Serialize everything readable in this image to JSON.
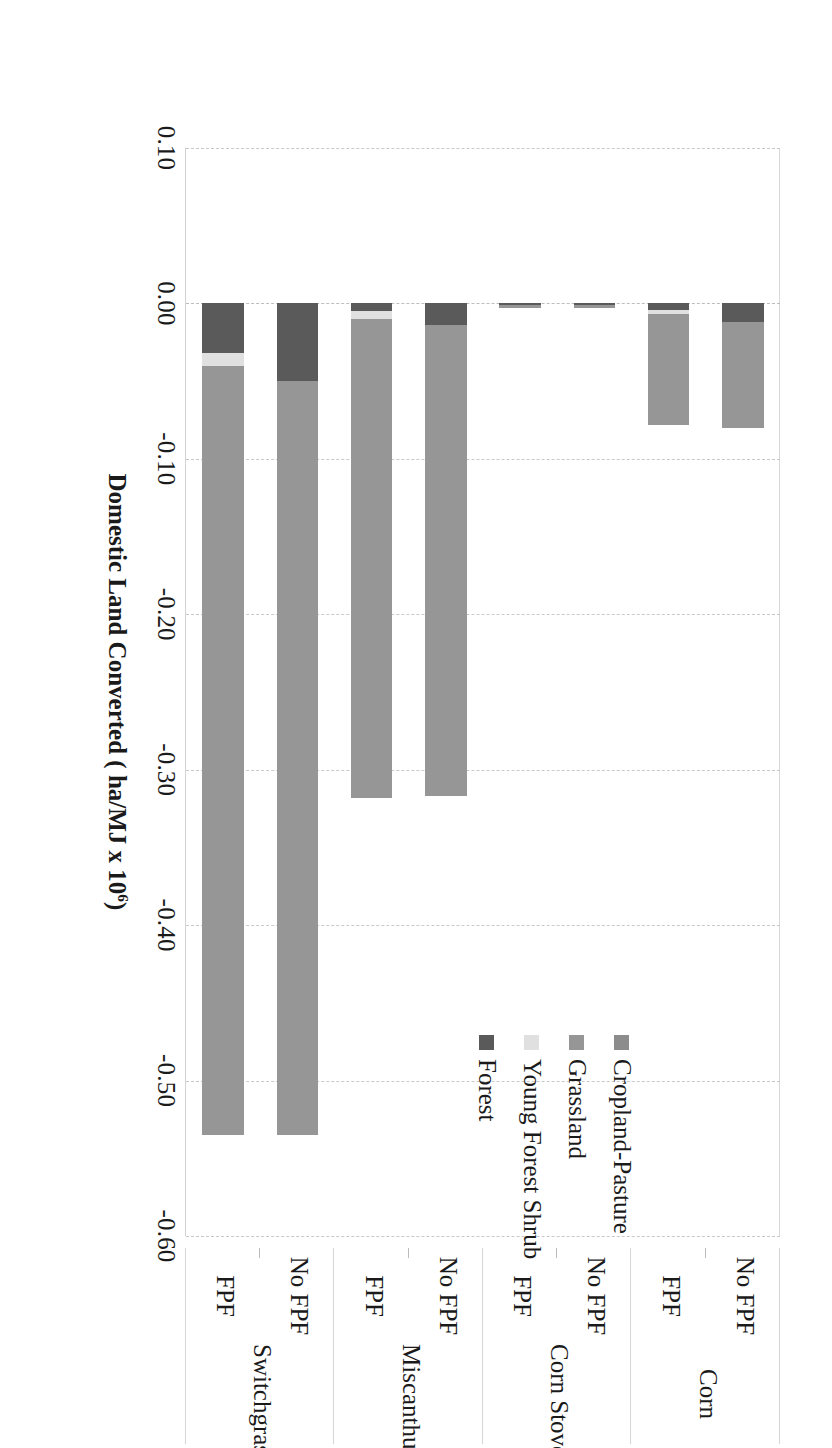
{
  "figure": {
    "orientation_note": "landscape-chart-rotated-90deg-in-portrait-page"
  },
  "chart_data": {
    "type": "bar",
    "orientation": "horizontal-stacked",
    "title": "",
    "xlabel": "Domestic Land Converted ( ha/MJ x 10⁶)",
    "ylabel": "",
    "xlim": [
      0.1,
      -0.6
    ],
    "grid": true,
    "legend_position": "inside-upper-right",
    "tick_labels": [
      "0.10",
      "0.00",
      "-0.10",
      "-0.20",
      "-0.30",
      "-0.40",
      "-0.50",
      "-0.60"
    ],
    "tick_values": [
      0.1,
      0.0,
      -0.1,
      -0.2,
      -0.3,
      -0.4,
      -0.5,
      -0.6
    ],
    "group_labels": [
      "Corn",
      "Corn Stover",
      "Miscanthus",
      "Switchgrass"
    ],
    "categories": [
      {
        "group": "Corn",
        "sub": "No FPF"
      },
      {
        "group": "Corn",
        "sub": "FPF"
      },
      {
        "group": "Corn Stover",
        "sub": "No FPF"
      },
      {
        "group": "Corn Stover",
        "sub": "FPF"
      },
      {
        "group": "Miscanthus",
        "sub": "No FPF"
      },
      {
        "group": "Miscanthus",
        "sub": "FPF"
      },
      {
        "group": "Switchgrass",
        "sub": "No FPF"
      },
      {
        "group": "Switchgrass",
        "sub": "FPF"
      }
    ],
    "series": [
      {
        "name": "Cropland-Pasture",
        "color": "#8c8c8c",
        "values": [
          0.0,
          0.0,
          0.0,
          0.0,
          0.0,
          0.0,
          0.0,
          0.0
        ]
      },
      {
        "name": "Grassland",
        "color": "#969696",
        "values": [
          -0.068,
          -0.071,
          -0.002,
          -0.002,
          -0.303,
          -0.308,
          -0.485,
          -0.495
        ]
      },
      {
        "name": "Young Forest Shrub",
        "color": "#e0e0e0",
        "values": [
          0.0,
          -0.003,
          0.0,
          0.0,
          0.0,
          -0.005,
          0.0,
          -0.008
        ]
      },
      {
        "name": "Forest",
        "color": "#5a5a5a",
        "values": [
          -0.012,
          -0.004,
          -0.001,
          -0.001,
          -0.014,
          -0.005,
          -0.05,
          -0.032
        ]
      }
    ],
    "stack_order": [
      "Forest",
      "Young Forest Shrub",
      "Grassland",
      "Cropland-Pasture"
    ],
    "bar_totals": [
      -0.08,
      -0.078,
      -0.003,
      -0.003,
      -0.317,
      -0.318,
      -0.535,
      -0.535
    ]
  },
  "legend": {
    "items": [
      {
        "label": "Cropland-Pasture",
        "color": "#8c8c8c"
      },
      {
        "label": "Grassland",
        "color": "#969696"
      },
      {
        "label": "Young Forest Shrub",
        "color": "#e0e0e0"
      },
      {
        "label": "Forest",
        "color": "#5a5a5a"
      }
    ]
  },
  "axis": {
    "title_main": "Domestic Land Converted ( ha/MJ x 10",
    "title_exp": "6",
    "title_tail": ")"
  }
}
